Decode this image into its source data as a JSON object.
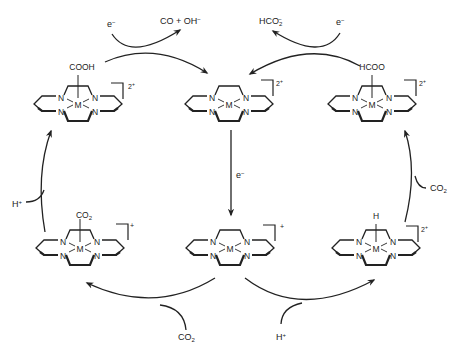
{
  "diagram": {
    "title": "",
    "type": "catalytic cycle",
    "complexes": [
      {
        "id": "top-left",
        "label": "[M(cyclam)(COOH)]",
        "axial_ligand": "COOH",
        "charge": "2+",
        "center": [
          78,
          102
        ]
      },
      {
        "id": "top-center",
        "label": "[M(cyclam)]",
        "axial_ligand": "",
        "charge": "2+",
        "center": [
          229,
          102
        ]
      },
      {
        "id": "top-right",
        "label": "[M(cyclam)(HCOO)]",
        "axial_ligand": "HCOO",
        "charge": "2+",
        "center": [
          372,
          102
        ]
      },
      {
        "id": "bottom-left",
        "label": "[M(cyclam)(CO2)]",
        "axial_ligand": "CO2",
        "charge": "+",
        "center": [
          80,
          246
        ]
      },
      {
        "id": "bottom-center",
        "label": "[M(cyclam)]",
        "axial_ligand": "",
        "charge": "+",
        "center": [
          230,
          246
        ]
      },
      {
        "id": "bottom-right",
        "label": "[M(cyclam)(H)]",
        "axial_ligand": "H",
        "charge": "2+",
        "center": [
          376,
          246
        ]
      }
    ],
    "atoms": {
      "metal": "M",
      "nitrogen": "N"
    },
    "ligands": {
      "top_left": "COOH",
      "top_right": "HCOO",
      "bottom_left": "CO",
      "bottom_left_sub": "2",
      "bottom_right": "H"
    },
    "charges": {
      "top_left": "2",
      "top_center": "2",
      "top_right": "2",
      "bottom_left": "+",
      "bottom_center": "+",
      "bottom_right": "2"
    },
    "reagents": {
      "top_left_in": {
        "base": "e",
        "sup": "−"
      },
      "top_left_out": {
        "base": "CO + OH",
        "sup": "−"
      },
      "top_right_out": {
        "base": "HCO",
        "sub": "2",
        "sup": "−"
      },
      "top_right_in": {
        "base": "e",
        "sup": "−"
      },
      "center_down": {
        "base": "e",
        "sup": "−"
      },
      "left_side_in": {
        "base": "H",
        "sup": "+"
      },
      "right_side_in": {
        "base": "CO",
        "sub": "2"
      },
      "bottom_left_in": {
        "base": "CO",
        "sub": "2"
      },
      "bottom_right_in": {
        "base": "H",
        "sup": "+"
      }
    },
    "colors": {
      "line": "#222222",
      "background": "#ffffff"
    }
  }
}
